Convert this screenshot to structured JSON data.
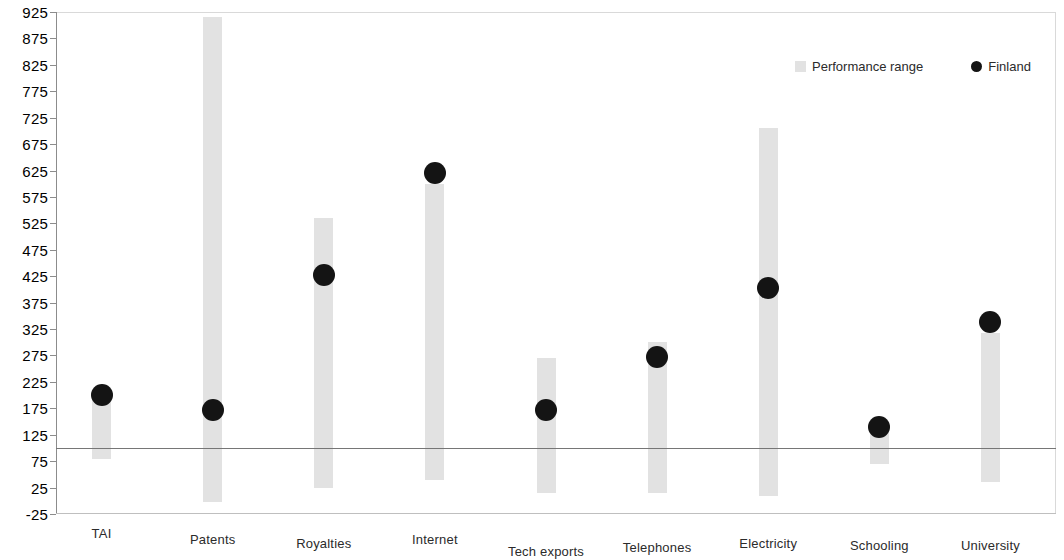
{
  "chart_data": {
    "type": "bar",
    "title": "",
    "subtitle": "",
    "xlabel": "",
    "ylabel": "",
    "ylim": [
      -25,
      925
    ],
    "ytick_step": 50,
    "yticks": [
      -25,
      25,
      75,
      125,
      175,
      225,
      275,
      325,
      375,
      425,
      475,
      525,
      575,
      625,
      675,
      725,
      775,
      825,
      875,
      925
    ],
    "ytick_labels": [
      "-25",
      "25",
      "75",
      "125",
      "175",
      "225",
      "275",
      "325",
      "375",
      "425",
      "475",
      "525",
      "575",
      "625",
      "675",
      "725",
      "775",
      "825",
      "875",
      "925"
    ],
    "grid": false,
    "legend_position": "top-right",
    "reference_line": {
      "value": 100,
      "label": ""
    },
    "categories": [
      "TAI",
      "Patents",
      "Royalties",
      "Internet",
      "Tech exports",
      "Telephones",
      "Electricity",
      "Schooling",
      "University"
    ],
    "series": [
      {
        "name": "Performance range",
        "type": "range-bar",
        "color": "#e2e2e2",
        "low": [
          80,
          -3,
          25,
          40,
          15,
          15,
          10,
          70,
          35
        ],
        "high": [
          205,
          915,
          535,
          600,
          270,
          300,
          705,
          140,
          318
        ]
      },
      {
        "name": "Finland",
        "type": "marker",
        "color": "#141414",
        "values": [
          200,
          172,
          428,
          620,
          172,
          272,
          402,
          140,
          338
        ]
      }
    ]
  },
  "legend": {
    "entries": [
      {
        "label": "Performance range",
        "swatch": "range-swatch-icon"
      },
      {
        "label": "Finland",
        "swatch": "finland-dot-icon"
      }
    ]
  }
}
